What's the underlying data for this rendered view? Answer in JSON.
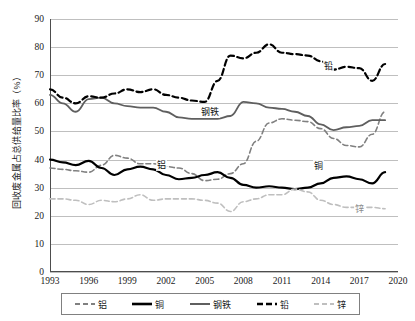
{
  "chart_data": {
    "type": "line",
    "title": "",
    "xlabel": "",
    "ylabel": "回收废金属占总供给量比率（%）",
    "xlim": [
      1993,
      2020
    ],
    "ylim": [
      0,
      90
    ],
    "xticks": [
      "1993",
      "1996",
      "1999",
      "2002",
      "2005",
      "2008",
      "2011",
      "2014",
      "2017",
      "2020"
    ],
    "yticks": [
      "0",
      "10",
      "20",
      "30",
      "40",
      "50",
      "60",
      "70",
      "80",
      "90"
    ],
    "grid": true,
    "legend_position": "bottom",
    "x": [
      1993,
      1994,
      1995,
      1996,
      1997,
      1998,
      1999,
      2000,
      2001,
      2002,
      2003,
      2004,
      2005,
      2006,
      2007,
      2008,
      2009,
      2010,
      2011,
      2012,
      2013,
      2014,
      2015,
      2016,
      2017,
      2018,
      2019
    ],
    "series": [
      {
        "name": "铝",
        "label": "铝",
        "color": "#808080",
        "style": "dashed",
        "width": 1.6,
        "values": [
          37,
          36.5,
          36,
          35.5,
          38,
          41.5,
          40.5,
          38.5,
          38.5,
          37.5,
          37,
          35,
          32.5,
          33,
          35,
          38.5,
          46.5,
          53,
          54.5,
          54,
          53.5,
          51,
          47.5,
          45,
          44.5,
          49,
          57
        ],
        "label_x": 2001.2,
        "label_y": 38.5
      },
      {
        "name": "铜",
        "label": "铜",
        "color": "#000000",
        "style": "solid",
        "width": 2.2,
        "values": [
          40,
          39,
          38,
          39.5,
          37,
          34.5,
          36.5,
          37.5,
          36.5,
          34.5,
          33,
          33.5,
          34.5,
          35.5,
          33.5,
          31,
          30,
          30.5,
          30,
          29.5,
          30,
          31.5,
          33.5,
          34,
          33,
          31.5,
          35.5
        ],
        "label_x": 2013.4,
        "label_y": 38.2
      },
      {
        "name": "钢铁",
        "label": "钢铁",
        "color": "#5f5f5f",
        "style": "solid",
        "width": 1.8,
        "values": [
          63,
          60,
          57,
          61.5,
          62,
          60,
          59,
          58.5,
          58.5,
          57,
          55,
          54.5,
          54.5,
          54.5,
          55.5,
          60.5,
          60,
          58.5,
          58,
          57,
          55.5,
          52.5,
          50.5,
          51.5,
          52,
          54,
          54
        ],
        "label_x": 2004.6,
        "label_y": 57.2
      },
      {
        "name": "铅",
        "label": "铅",
        "color": "#000000",
        "style": "dashed",
        "width": 2.2,
        "values": [
          65,
          62,
          60,
          62.5,
          62,
          63.5,
          65,
          64,
          65,
          63,
          62,
          61,
          60.5,
          68,
          77,
          76,
          78,
          81,
          78,
          77.5,
          77,
          75,
          72,
          73,
          72.5,
          68,
          74
        ],
        "label_x": 2014.2,
        "label_y": 73.5
      },
      {
        "name": "锌",
        "label": "锌",
        "color": "#bfbfbf",
        "style": "dashed",
        "width": 1.6,
        "values": [
          26,
          26,
          25.5,
          24,
          25.5,
          25,
          26,
          27.5,
          25.5,
          26,
          26,
          26,
          25.5,
          24.5,
          21.5,
          25,
          26,
          27.5,
          27.5,
          29.5,
          28.5,
          25.5,
          24,
          23,
          23,
          23,
          22.5
        ],
        "label_x": 2016.6,
        "label_y": 22.8
      }
    ],
    "legend": [
      {
        "name": "铝",
        "color": "#808080",
        "style": "dashed",
        "width": 1.8
      },
      {
        "name": "铜",
        "color": "#000000",
        "style": "solid",
        "width": 2.6
      },
      {
        "name": "钢铁",
        "color": "#5f5f5f",
        "style": "solid",
        "width": 2.0
      },
      {
        "name": "铅",
        "color": "#000000",
        "style": "dashed",
        "width": 2.6
      },
      {
        "name": "锌",
        "color": "#bfbfbf",
        "style": "dashed",
        "width": 1.8
      }
    ]
  }
}
